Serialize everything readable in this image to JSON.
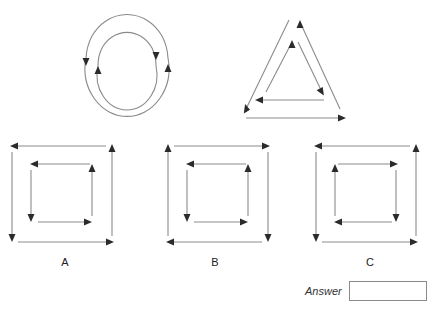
{
  "puzzle": {
    "type": "visual-analogy-rotation",
    "stimulus": {
      "left_figure": {
        "name": "concentric-circles-arrows",
        "description": "Two concentric circular arcs, each drawn with arrowheads",
        "outer_arc": {
          "direction": "clockwise",
          "arrowheads": [
            "left-pointing-down",
            "right-pointing-up"
          ]
        },
        "inner_arc": {
          "direction": "counterclockwise",
          "arrowheads": [
            "left-pointing-up",
            "right-pointing-down"
          ]
        }
      },
      "right_figure": {
        "name": "nested-triangles-arrows",
        "description": "Two nested triangles built from arrow segments",
        "outer_triangle": {
          "direction": "clockwise",
          "base_arrow": "right"
        },
        "inner_triangle": {
          "direction": "counterclockwise",
          "base_arrow": "left"
        }
      }
    },
    "options": [
      {
        "id": "A",
        "label": "A",
        "outer_square": {
          "direction": "counterclockwise",
          "top_arrow": "left",
          "bottom_arrow": "right",
          "left_arrow": "down",
          "right_arrow": "up"
        },
        "inner_square": {
          "direction": "counterclockwise",
          "top_arrow": "left",
          "bottom_arrow": "right",
          "left_arrow": "down",
          "right_arrow": "up"
        }
      },
      {
        "id": "B",
        "label": "B",
        "outer_square": {
          "direction": "clockwise",
          "top_arrow": "right",
          "bottom_arrow": "left",
          "left_arrow": "up",
          "right_arrow": "down"
        },
        "inner_square": {
          "direction": "counterclockwise",
          "top_arrow": "left",
          "bottom_arrow": "right",
          "left_arrow": "down",
          "right_arrow": "up"
        }
      },
      {
        "id": "C",
        "label": "C",
        "outer_square": {
          "direction": "counterclockwise",
          "top_arrow": "left",
          "bottom_arrow": "right",
          "left_arrow": "down",
          "right_arrow": "up"
        },
        "inner_square": {
          "direction": "clockwise",
          "top_arrow": "right",
          "bottom_arrow": "left",
          "left_arrow": "up",
          "right_arrow": "down"
        }
      }
    ],
    "answer": {
      "label": "Answer",
      "value": "",
      "placeholder": ""
    },
    "colors": {
      "line": "#8b8b8b",
      "arrowhead": "#2b2b2b",
      "text": "#333333",
      "box_border": "#8a8a8a",
      "background": "#ffffff"
    }
  }
}
